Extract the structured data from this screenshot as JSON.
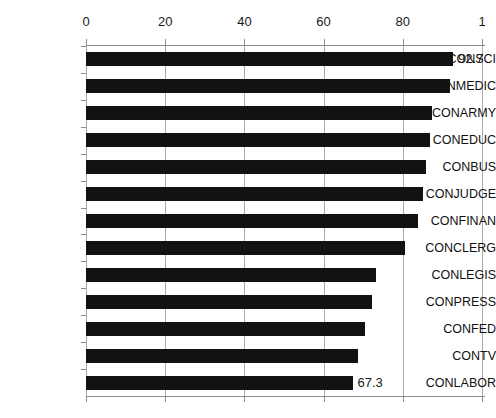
{
  "chart_data": {
    "type": "bar",
    "orientation": "horizontal",
    "title": "",
    "xlabel": "",
    "ylabel": "",
    "xlim": [
      0,
      100
    ],
    "ylim": null,
    "grid": true,
    "legend": null,
    "xticks": [
      {
        "value": 0,
        "label": "0"
      },
      {
        "value": 20,
        "label": "20"
      },
      {
        "value": 40,
        "label": "40"
      },
      {
        "value": 60,
        "label": "60"
      },
      {
        "value": 80,
        "label": "80"
      },
      {
        "value": 100,
        "label": "1"
      }
    ],
    "categories": [
      "CONSCI",
      "CONMEDIC",
      "CONARMY",
      "CONEDUC",
      "CONBUS",
      "CONJUDGE",
      "CONFINAN",
      "CONCLERG",
      "CONLEGIS",
      "CONPRESS",
      "CONFED",
      "CONTV",
      "CONLABOR"
    ],
    "values": [
      92.7,
      92.0,
      87.4,
      86.9,
      85.9,
      85.1,
      83.8,
      80.6,
      73.2,
      72.2,
      70.5,
      68.7,
      67.3
    ],
    "data_labels": [
      {
        "index": 0,
        "text": "92.7"
      },
      {
        "index": 12,
        "text": "67.3"
      }
    ],
    "bar_color": "#121212",
    "gridline_color": "#a9a9a9",
    "axis_color": "#8c8c8c",
    "background_color": "#ffffff"
  }
}
